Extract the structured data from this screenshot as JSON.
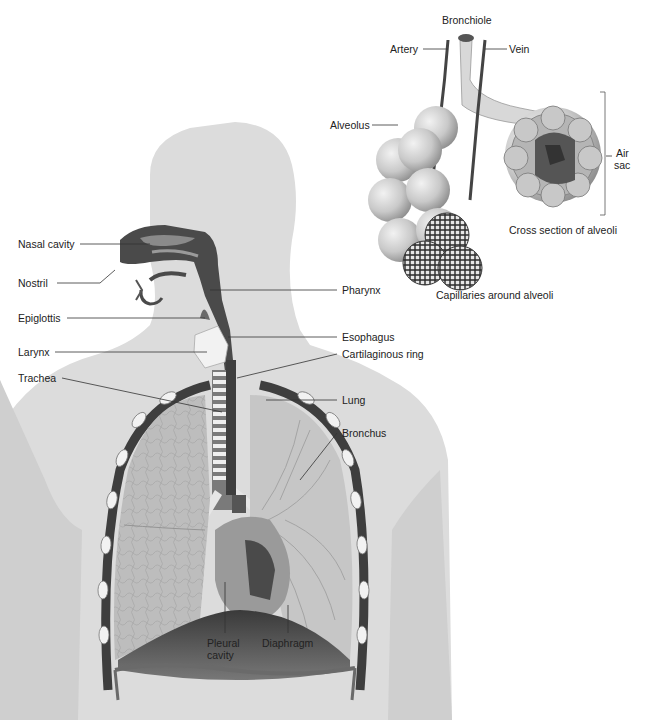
{
  "colors": {
    "background": "#ffffff",
    "body_silhouette": "#dcdcdc",
    "dark_airway": "#4a4a4a",
    "lung_fill": "#bdbdbd",
    "alveolus_fill": "#c8c8c8",
    "capillary": "#3a3a3a",
    "label_text": "#222222",
    "leader_line": "#333333"
  },
  "detail_inset": {
    "labels": {
      "bronchiole": "Bronchiole",
      "artery": "Artery",
      "vein": "Vein",
      "alveolus": "Alveolus",
      "air_sac_line1": "Air",
      "air_sac_line2": "sac",
      "cross_section": "Cross section of alveoli",
      "capillaries": "Capillaries around alveoli"
    }
  },
  "main_figure": {
    "left_labels": {
      "nasal_cavity": "Nasal cavity",
      "nostril": "Nostril",
      "epiglottis": "Epiglottis",
      "larynx": "Larynx",
      "trachea": "Trachea"
    },
    "right_labels": {
      "pharynx": "Pharynx",
      "esophagus": "Esophagus",
      "cartilaginous_ring": "Cartilaginous ring",
      "lung": "Lung",
      "bronchus": "Bronchus"
    },
    "bottom_labels": {
      "pleural_line1": "Pleural",
      "pleural_line2": "cavity",
      "diaphragm": "Diaphragm"
    }
  }
}
